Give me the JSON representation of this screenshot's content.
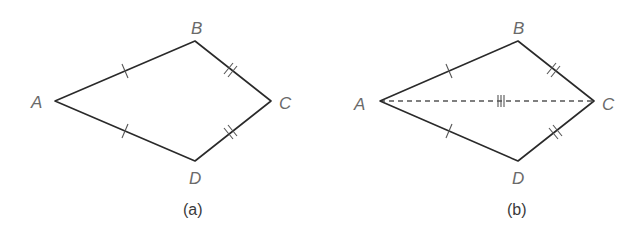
{
  "figures": [
    {
      "caption": "(a)",
      "vertices": {
        "A": {
          "label": "A"
        },
        "B": {
          "label": "B"
        },
        "C": {
          "label": "C"
        },
        "D": {
          "label": "D"
        }
      },
      "edges": [
        "AB",
        "BC",
        "CD",
        "DA"
      ],
      "congruence_marks": {
        "AB": 1,
        "AD": 1,
        "BC": 2,
        "CD": 2
      },
      "diagonal": null
    },
    {
      "caption": "(b)",
      "vertices": {
        "A": {
          "label": "A"
        },
        "B": {
          "label": "B"
        },
        "C": {
          "label": "C"
        },
        "D": {
          "label": "D"
        }
      },
      "edges": [
        "AB",
        "BC",
        "CD",
        "DA"
      ],
      "congruence_marks": {
        "AB": 1,
        "AD": 1,
        "BC": 2,
        "CD": 2,
        "AC": 3
      },
      "diagonal": {
        "from": "A",
        "to": "C",
        "style": "dashed"
      }
    }
  ]
}
